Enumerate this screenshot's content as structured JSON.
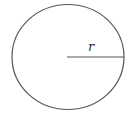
{
  "diagram": {
    "type": "circle-with-radius",
    "circle": {
      "cx": 68,
      "cy": 57,
      "rx": 56,
      "ry": 52.5,
      "stroke": "#555555",
      "stroke_width": 1.2
    },
    "radius_line": {
      "x1": 67,
      "y1": 57,
      "x2": 124,
      "y2": 57,
      "stroke": "#555555"
    },
    "radius_label": {
      "text": "r",
      "x": 88,
      "y": 51
    }
  }
}
